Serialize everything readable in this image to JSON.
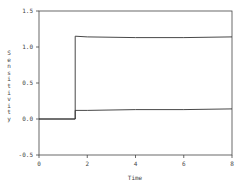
{
  "chart_data": {
    "type": "line",
    "title": "",
    "xlabel": "Time",
    "ylabel": "Sensitivity",
    "xlim": [
      0,
      8
    ],
    "ylim": [
      -0.5,
      1.5
    ],
    "x_ticks": [
      0,
      2,
      4,
      6,
      8
    ],
    "x_tick_labels": [
      "0",
      "2",
      "4",
      "6",
      "8"
    ],
    "y_ticks": [
      1.5,
      1.0,
      0.5,
      0.0,
      -0.5
    ],
    "y_tick_labels": [
      "1.5",
      "1.0",
      "0.5",
      "0.0",
      "-0.5"
    ],
    "grid": false,
    "legend": null,
    "series": [
      {
        "name": "upper",
        "points": [
          [
            0,
            0.0
          ],
          [
            1.5,
            0.0
          ],
          [
            1.5,
            1.15
          ],
          [
            2,
            1.14
          ],
          [
            4,
            1.13
          ],
          [
            6,
            1.13
          ],
          [
            8,
            1.14
          ]
        ]
      },
      {
        "name": "lower",
        "points": [
          [
            0,
            0.0
          ],
          [
            1.5,
            0.0
          ],
          [
            1.5,
            0.12
          ],
          [
            2,
            0.12
          ],
          [
            4,
            0.13
          ],
          [
            6,
            0.13
          ],
          [
            8,
            0.14
          ]
        ]
      }
    ]
  },
  "colors": {
    "line": "#333333",
    "axis": "#444444",
    "text": "#444444"
  }
}
